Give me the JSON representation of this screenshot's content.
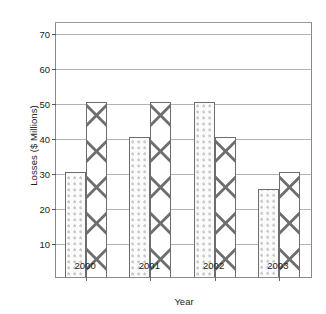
{
  "chart_data": {
    "type": "bar",
    "title": "",
    "xlabel": "Year",
    "ylabel": "Losses ($ Millions)",
    "categories": [
      "2000",
      "2001",
      "2002",
      "2003"
    ],
    "series": [
      {
        "name": "series-dotted",
        "pattern": "dots",
        "values": [
          30,
          40,
          50,
          25
        ]
      },
      {
        "name": "series-crosshatch",
        "pattern": "cross",
        "values": [
          50,
          50,
          40,
          30
        ]
      }
    ],
    "ylim": [
      0,
      73
    ],
    "yticks": [
      10,
      20,
      30,
      40,
      50,
      60,
      70
    ],
    "ytick_labels": [
      "10",
      "20",
      "30",
      "40",
      "50",
      "60",
      "70"
    ],
    "grid": true,
    "legend": "none",
    "colors": {
      "frame": "#8a8a8a",
      "grid": "#b3b3b3",
      "bar_outline": "#6d6d6d",
      "dot_fill": "#c9c9c9",
      "cross_line": "#6f6f6f",
      "text": "#222222",
      "background": "#ffffff"
    }
  }
}
